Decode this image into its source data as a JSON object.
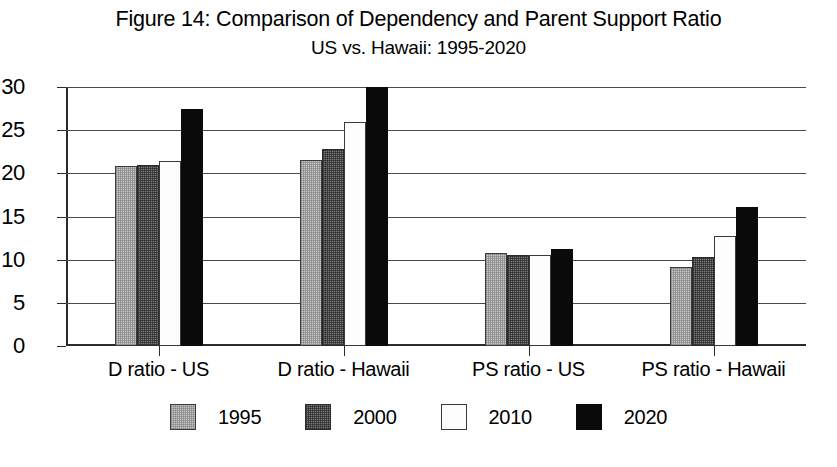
{
  "chart_data": {
    "type": "bar",
    "title": "Figure 14: Comparison of Dependency and Parent Support Ratio",
    "subtitle": "US vs. Hawaii: 1995-2020",
    "xlabel": "",
    "ylabel": "",
    "ylim": [
      0,
      30
    ],
    "ytick_step": 5,
    "yticks": [
      "0",
      "5",
      "10",
      "15",
      "20",
      "25",
      "30"
    ],
    "grid": true,
    "legend_position": "bottom",
    "categories": [
      "D ratio - US",
      "D ratio - Hawaii",
      "PS ratio - US",
      "PS ratio - Hawaii"
    ],
    "series": [
      {
        "name": "1995",
        "color": "#c9c9c9",
        "values": [
          20.9,
          21.6,
          10.8,
          9.2
        ]
      },
      {
        "name": "2000",
        "color": "#7d7d7d",
        "values": [
          21.0,
          22.8,
          10.6,
          10.3
        ]
      },
      {
        "name": "2010",
        "color": "#ffffff",
        "values": [
          21.4,
          25.9,
          10.6,
          12.8
        ]
      },
      {
        "name": "2020",
        "color": "#0a0a0a",
        "values": [
          27.5,
          30.3,
          11.2,
          16.1
        ]
      }
    ]
  },
  "legend": {
    "entries": [
      {
        "label": "1995"
      },
      {
        "label": "2000"
      },
      {
        "label": "2010"
      },
      {
        "label": "2020"
      }
    ]
  }
}
